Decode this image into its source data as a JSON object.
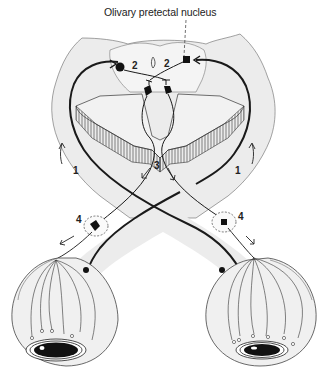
{
  "figure": {
    "title_label": "Olivary pretectal nucleus",
    "pathway_numbers": {
      "retinal_afferent_left": "1",
      "retinal_afferent_right": "1",
      "pretectal_left": "2",
      "pretectal_right": "2",
      "edinger_westphal": "3",
      "ciliary_ganglion_left": "4",
      "ciliary_ganglion_right": "4"
    },
    "colors": {
      "shading": "#ebebeb",
      "ink": "#1a1a1a",
      "background": "#ffffff"
    }
  }
}
